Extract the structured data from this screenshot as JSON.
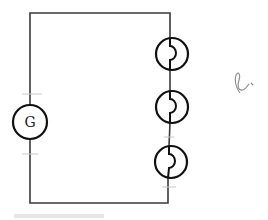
{
  "diagram": {
    "type": "circuit-schematic",
    "generator": {
      "label": "G"
    },
    "lamps": [
      {
        "id": "lamp-1"
      },
      {
        "id": "lamp-2"
      },
      {
        "id": "lamp-3"
      }
    ],
    "handwritten_note": "ℓ",
    "colors": {
      "wire": "#3a3a3a",
      "symbol": "#111111",
      "background": "#ffffff"
    }
  }
}
